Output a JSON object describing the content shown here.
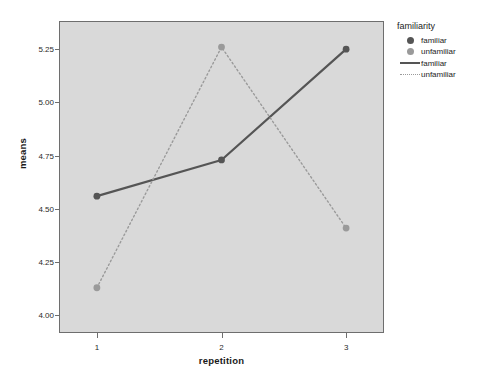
{
  "chart_data": {
    "type": "line",
    "title": "",
    "xlabel": "repetition",
    "ylabel": "means",
    "categories": [
      "1",
      "2",
      "3"
    ],
    "x": [
      1,
      2,
      3
    ],
    "xlim": [
      0.7,
      3.3
    ],
    "ylim": [
      3.92,
      5.38
    ],
    "grid": false,
    "legend_position": "right",
    "legend_title": "familiarity",
    "ytick_labels": [
      "5.25",
      "5.00",
      "4.75",
      "4.50",
      "4.25",
      "4.00"
    ],
    "ytick_values": [
      5.25,
      5.0,
      4.75,
      4.5,
      4.25,
      4.0
    ],
    "xtick_labels": [
      "1",
      "2",
      "3"
    ],
    "series": [
      {
        "name": "familiar",
        "style": "solid",
        "color": "#555555",
        "marker_color": "#555555",
        "values": [
          4.56,
          4.73,
          5.25
        ]
      },
      {
        "name": "unfamiliar",
        "style": "dotted",
        "color": "#9a9a9a",
        "marker_color": "#9a9a9a",
        "values": [
          4.13,
          5.26,
          4.41
        ]
      }
    ]
  },
  "legend": {
    "title": "familiarity",
    "entries": [
      {
        "label": "familiar",
        "type": "dot",
        "color": "#555555"
      },
      {
        "label": "unfamiliar",
        "type": "dot",
        "color": "#9a9a9a"
      },
      {
        "label": "familiar",
        "type": "line-solid",
        "color": "#555555"
      },
      {
        "label": "unfamiliar",
        "type": "line-dotted",
        "color": "#9a9a9a"
      }
    ]
  },
  "colors": {
    "plot_background": "#d9d9d9",
    "page_background": "#ffffff",
    "frame": "#6e6e6e",
    "familiar": "#555555",
    "unfamiliar": "#9a9a9a",
    "text": "#1c1c1c"
  }
}
